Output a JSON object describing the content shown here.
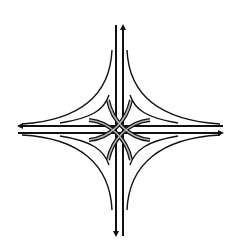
{
  "diagram": {
    "type": "highway-interchange",
    "style": "four-level stack interchange",
    "background": "#ffffff",
    "line_color": "#111111",
    "ramp_highlight_color": "#9a9a9a",
    "center": [
      119.5,
      129.5
    ],
    "roads": {
      "north_south": {
        "lanes_x": [
          116,
          123
        ],
        "y_range": [
          25,
          236
        ]
      },
      "east_west": {
        "lanes_y": [
          126,
          133
        ],
        "x_range": [
          18,
          223
        ]
      }
    },
    "arrows": [
      {
        "name": "north-arrow",
        "x": 123,
        "y": 25,
        "direction": "up"
      },
      {
        "name": "south-arrow",
        "x": 116,
        "y": 236,
        "direction": "down"
      },
      {
        "name": "west-arrow",
        "x": 18,
        "y": 126,
        "direction": "left"
      },
      {
        "name": "east-arrow",
        "x": 223,
        "y": 133,
        "direction": "right"
      }
    ]
  }
}
